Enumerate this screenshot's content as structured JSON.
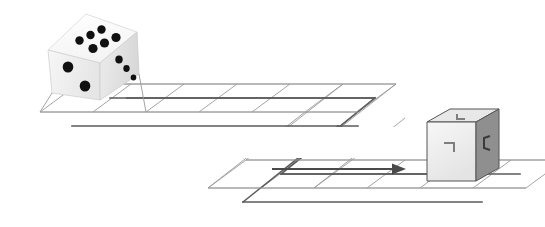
{
  "figure": {
    "background_color": "#ffffff",
    "width": 545,
    "height": 227
  },
  "die": {
    "name": "rolling-die",
    "position": {
      "x": 48,
      "y": 12,
      "width": 92,
      "height": 90
    },
    "body_color": "#f2f2f2",
    "top_face_color": "#fbfbfb",
    "left_face_color": "#ececec",
    "right_face_color": "#e2e2e2",
    "pip_color": "#111111",
    "edge_color": "#cfcfcf",
    "faces": [
      {
        "name": "top-face",
        "value": 6,
        "label": "6"
      },
      {
        "name": "front-left-face",
        "value": 2,
        "label": "2"
      },
      {
        "name": "right-face",
        "value": 3,
        "label": "3"
      }
    ],
    "top_pips": [
      {
        "cx": 79.5,
        "cy": 40.5,
        "r": 4.2
      },
      {
        "cx": 90.5,
        "cy": 35.5,
        "r": 4.2
      },
      {
        "cx": 101.0,
        "cy": 30.5,
        "r": 4.2
      },
      {
        "cx": 92.5,
        "cy": 48.0,
        "r": 4.6
      },
      {
        "cx": 104.0,
        "cy": 42.5,
        "r": 4.6
      },
      {
        "cx": 115.0,
        "cy": 37.5,
        "r": 4.6
      }
    ],
    "left_pips": [
      {
        "cx": 68.0,
        "cy": 66.0,
        "r": 5.4
      },
      {
        "cx": 84.0,
        "cy": 85.0,
        "r": 5.4
      }
    ],
    "right_pips": [
      {
        "cx": 119.0,
        "cy": 60.0,
        "r": 3.6
      },
      {
        "cx": 126.0,
        "cy": 68.0,
        "r": 3.1
      },
      {
        "cx": 133.0,
        "cy": 76.0,
        "r": 2.8
      }
    ]
  },
  "target_cube": {
    "name": "target-cube",
    "position": {
      "x": 427,
      "y": 109,
      "width": 72,
      "height": 72
    },
    "front_face_color": "#f0f0f0",
    "top_face_color": "#e6e6e6",
    "right_face_color": "#8f8f8f",
    "outline_color": "#555555",
    "mark_color": "#7a7a7a",
    "marks": [
      {
        "name": "top-face-mark",
        "glyph": "L-bracket",
        "description": "corner bracket on top face"
      },
      {
        "name": "front-face-mark",
        "glyph": "upper-right-bracket",
        "description": "corner bracket on front face"
      },
      {
        "name": "right-face-mark",
        "glyph": "C-bracket",
        "description": "corner bracket on right face"
      }
    ]
  },
  "grid": {
    "name": "isometric-grid-path",
    "line_color": "#9a9a9a",
    "path_color": "#5a5a5a",
    "line_width": 0.9,
    "path_width": 1.5,
    "shear": "parallel-oblique-projection",
    "upper_strip": {
      "name": "upper-grid-strip",
      "cells": 6,
      "origin": {
        "x": 40,
        "y": 112
      },
      "cell_width": 53,
      "depth": 38
    },
    "lower_strip": {
      "name": "lower-grid-strip",
      "cells": 6,
      "origin": {
        "x": 208,
        "y": 188
      },
      "cell_width": 53,
      "depth": 38
    }
  },
  "arrow": {
    "name": "direction-arrow",
    "color": "#4a4a4a",
    "from": {
      "x": 272,
      "y": 169
    },
    "to": {
      "x": 401,
      "y": 169
    },
    "direction": "right"
  }
}
